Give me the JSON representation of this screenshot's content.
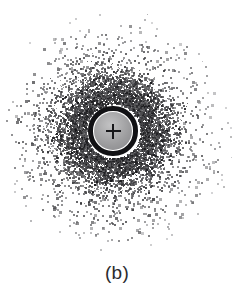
{
  "figure": {
    "caption": "(b)",
    "caption_x": 117,
    "caption_y": 263,
    "background_color": "#ffffff",
    "width": 234,
    "height": 297
  },
  "colors": {
    "background": "#ffffff",
    "speckle_dark": "#1c1c20",
    "speckle_mid": "#4a4a50",
    "speckle_light": "#8e8e95",
    "beam_stop_ring": "#121215",
    "beam_stop_disc": "#9a9a9c",
    "beam_stop_disc_highlight": "#c2c2c3",
    "cross_marker": "#17171a",
    "caption_text": "#2b2b2e"
  },
  "beam_stop": {
    "label": "beam-stop",
    "center_x": 113,
    "center_y": 131,
    "ring_outer_radius": 25,
    "ring_thickness": 5.5,
    "disc_radius": 19,
    "cross_arm_length": 15,
    "cross_thickness": 2.4
  },
  "chart_data": {
    "type": "scatter",
    "title": "",
    "subtitle": "",
    "xlabel": "",
    "ylabel": "",
    "annotations": [
      "(b)"
    ],
    "legend": [],
    "grid": false,
    "axis_visible": false,
    "xlim": [
      0,
      234
    ],
    "ylim": [
      0,
      252
    ],
    "center": [
      113,
      131
    ],
    "seed": 20240917,
    "radial_profile": {
      "inner_clear_radius": 27,
      "outer_radius": 118,
      "peak_density_radius": 40,
      "bands": [
        {
          "r_min": 27,
          "r_max": 34,
          "count": 1500,
          "dot_min": 1.0,
          "dot_max": 1.9,
          "gray_min": 20,
          "gray_max": 90,
          "opacity": 0.95
        },
        {
          "r_min": 34,
          "r_max": 44,
          "count": 1750,
          "dot_min": 1.0,
          "dot_max": 2.0,
          "gray_min": 22,
          "gray_max": 98,
          "opacity": 0.93
        },
        {
          "r_min": 44,
          "r_max": 56,
          "count": 1350,
          "dot_min": 1.1,
          "dot_max": 2.1,
          "gray_min": 28,
          "gray_max": 108,
          "opacity": 0.9
        },
        {
          "r_min": 56,
          "r_max": 68,
          "count": 720,
          "dot_min": 1.2,
          "dot_max": 2.3,
          "gray_min": 34,
          "gray_max": 120,
          "opacity": 0.88
        },
        {
          "r_min": 68,
          "r_max": 82,
          "count": 400,
          "dot_min": 1.4,
          "dot_max": 2.6,
          "gray_min": 44,
          "gray_max": 132,
          "opacity": 0.85
        },
        {
          "r_min": 82,
          "r_max": 98,
          "count": 250,
          "dot_min": 1.5,
          "dot_max": 2.8,
          "gray_min": 56,
          "gray_max": 145,
          "opacity": 0.82
        },
        {
          "r_min": 98,
          "r_max": 112,
          "count": 120,
          "dot_min": 1.5,
          "dot_max": 2.8,
          "gray_min": 76,
          "gray_max": 160,
          "opacity": 0.75
        },
        {
          "r_min": 112,
          "r_max": 124,
          "count": 38,
          "dot_min": 1.4,
          "dot_max": 2.6,
          "gray_min": 100,
          "gray_max": 175,
          "opacity": 0.6
        }
      ],
      "hot_clumps": [
        {
          "angle_deg": 18,
          "radius": 44,
          "spread": 11,
          "count": 260
        },
        {
          "angle_deg": 96,
          "radius": 40,
          "spread": 10,
          "count": 220
        },
        {
          "angle_deg": 156,
          "radius": 46,
          "spread": 12,
          "count": 210
        },
        {
          "angle_deg": 210,
          "radius": 38,
          "spread": 10,
          "count": 190
        },
        {
          "angle_deg": 268,
          "radius": 45,
          "spread": 11,
          "count": 230
        },
        {
          "angle_deg": 330,
          "radius": 42,
          "spread": 10,
          "count": 200
        }
      ]
    }
  }
}
